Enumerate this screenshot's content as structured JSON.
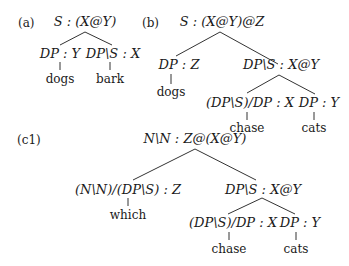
{
  "panels": [
    {
      "tag": "(a)",
      "root": "S : (X@Y)",
      "children": [
        {
          "label": "DP : Y",
          "word": "dogs"
        },
        {
          "label": "DP\\S : X",
          "word": "bark"
        }
      ]
    },
    {
      "tag": "(b)",
      "root": "S : (X@Y)@Z",
      "children": [
        {
          "label": "DP : Z",
          "word": "dogs"
        },
        {
          "label": "DP\\S : X@Y",
          "children": [
            {
              "label": "(DP\\S)/DP : X",
              "word": "chase"
            },
            {
              "label": "DP : Y",
              "word": "cats"
            }
          ]
        }
      ]
    },
    {
      "tag": "(c1)",
      "root": "N\\N : Z@(X@Y)",
      "children": [
        {
          "label": "(N\\N)/(DP\\S) : Z",
          "word": "which"
        },
        {
          "label": "DP\\S : X@Y",
          "children": [
            {
              "label": "(DP\\S)/DP : X",
              "word": "chase"
            },
            {
              "label": "DP : Y",
              "word": "cats"
            }
          ]
        }
      ]
    }
  ]
}
